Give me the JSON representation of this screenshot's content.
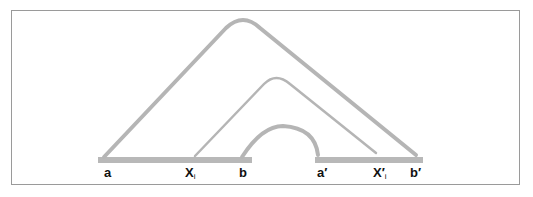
{
  "diagram": {
    "colors": {
      "line": "#b5b5b5",
      "frame": "#9a9a9a",
      "text": "#111111"
    },
    "segments": [
      {
        "id": "segment-ab",
        "from": "a",
        "to": "b"
      },
      {
        "id": "segment-a-prime-b-prime",
        "from": "a′",
        "to": "b′"
      }
    ],
    "arcs": [
      {
        "id": "outer-arc",
        "from": "a",
        "to": "b′"
      },
      {
        "id": "middle-arc",
        "from": "xi",
        "to": "x′i"
      },
      {
        "id": "inner-arc",
        "from": "b",
        "to": "a′"
      }
    ],
    "labels": {
      "a": "a",
      "xi_main": "X",
      "xi_sub": "i",
      "b": "b",
      "a_prime": "a′",
      "x_prime_main": "X′",
      "x_prime_sub": "i",
      "b_prime": "b′"
    }
  }
}
